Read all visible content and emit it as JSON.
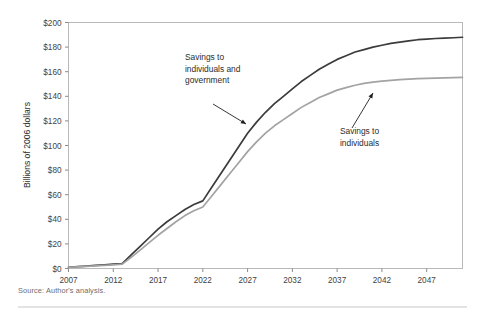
{
  "figure": {
    "source_note": "Source: Author's analysis."
  },
  "chart_data": {
    "type": "line",
    "title": "",
    "xlabel": "",
    "ylabel": "Billions of 2006 dollars",
    "xlim": [
      2007,
      2051
    ],
    "ylim": [
      0,
      200
    ],
    "grid": false,
    "legend_position": "inline-annotations",
    "x_ticks": [
      "2007",
      "2012",
      "2017",
      "2022",
      "2027",
      "2032",
      "2037",
      "2042",
      "2047"
    ],
    "x_tick_values": [
      2007,
      2012,
      2017,
      2022,
      2027,
      2032,
      2037,
      2042,
      2047
    ],
    "y_ticks": [
      "$0",
      "$20",
      "$40",
      "$60",
      "$80",
      "$100",
      "$120",
      "$140",
      "$160",
      "$180",
      "$200"
    ],
    "y_tick_values": [
      0,
      20,
      40,
      60,
      80,
      100,
      120,
      140,
      160,
      180,
      200
    ],
    "x": [
      2007,
      2008,
      2009,
      2010,
      2011,
      2012,
      2013,
      2014,
      2015,
      2016,
      2017,
      2018,
      2019,
      2020,
      2021,
      2022,
      2023,
      2024,
      2025,
      2026,
      2027,
      2028,
      2029,
      2030,
      2031,
      2032,
      2033,
      2034,
      2035,
      2036,
      2037,
      2038,
      2039,
      2040,
      2041,
      2042,
      2043,
      2044,
      2045,
      2046,
      2047,
      2048,
      2049,
      2050,
      2051
    ],
    "series": [
      {
        "name": "Savings to individuals and government",
        "color": "#3b3b3b",
        "values": [
          1,
          1.5,
          2,
          2.5,
          3,
          3.5,
          4,
          11,
          18,
          25,
          32,
          38,
          43,
          48,
          52,
          55,
          66,
          77,
          88,
          99,
          110,
          119,
          127,
          134,
          140,
          146,
          152,
          157,
          162,
          166,
          170,
          173,
          176,
          178,
          180,
          181.5,
          183,
          184,
          185,
          186,
          186.5,
          187,
          187.3,
          187.6,
          188
        ]
      },
      {
        "name": "Savings to individuals",
        "color": "#a3a3a3",
        "values": [
          1,
          1.3,
          1.7,
          2.1,
          2.5,
          3,
          3.5,
          9,
          15,
          21,
          27,
          32.5,
          38,
          43,
          47,
          50,
          59,
          68,
          77,
          86,
          95,
          103,
          110,
          116,
          121,
          126,
          131,
          135,
          139,
          142,
          145,
          147,
          149,
          150.5,
          151.5,
          152.3,
          153,
          153.5,
          154,
          154.3,
          154.6,
          154.8,
          155,
          155.2,
          155.4
        ]
      }
    ],
    "annotations": [
      {
        "name": "savings-to-individuals-and-government",
        "lines": [
          "Savings to",
          "individuals and",
          "government"
        ],
        "text_x": 185,
        "text_y": 60,
        "arrow_from": [
          213,
          104
        ],
        "arrow_to": [
          246,
          124
        ]
      },
      {
        "name": "savings-to-individuals",
        "lines": [
          "Savings to",
          "individuals"
        ],
        "text_x": 340,
        "text_y": 134,
        "arrow_from": [
          352,
          128
        ],
        "arrow_to": [
          373,
          93
        ]
      }
    ]
  }
}
